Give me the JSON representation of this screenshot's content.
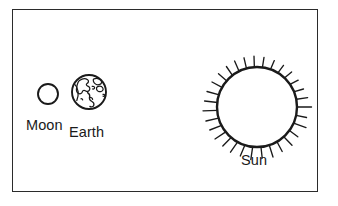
{
  "diagram": {
    "background_color": "#ffffff",
    "stroke_color": "#1a1a1a",
    "frame": {
      "name": "diagram-border",
      "color": "#2b2b2b",
      "x": 12,
      "y": 9,
      "width": 306,
      "height": 183
    },
    "bodies": [
      {
        "id": "moon",
        "label": "Moon",
        "shape": "circle-outline",
        "cx": 48,
        "cy": 94,
        "r": 10,
        "fill": "#ffffff",
        "stroke": "#1a1a1a",
        "label_x": 26,
        "label_y": 118
      },
      {
        "id": "earth",
        "label": "Earth",
        "shape": "globe-with-continents",
        "cx": 89,
        "cy": 92,
        "r": 17,
        "fill": "#ffffff",
        "stroke": "#1a1a1a",
        "label_x": 69,
        "label_y": 125
      },
      {
        "id": "sun",
        "label": "Sun",
        "shape": "circle-with-rays",
        "cx": 257,
        "cy": 107,
        "r": 40,
        "fill": "#ffffff",
        "stroke": "#1a1a1a",
        "ray_count": 30,
        "label_x": 241,
        "label_y": 153
      }
    ]
  }
}
